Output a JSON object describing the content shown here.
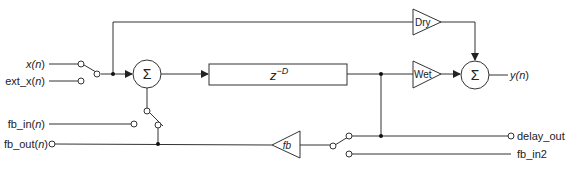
{
  "diagram": {
    "inputs": {
      "x_n": {
        "pre": "x(",
        "var": "n",
        "post": ")"
      },
      "ext_x_n": {
        "pre": "ext_x(",
        "var": "n",
        "post": ")"
      },
      "fb_in_n": {
        "pre": "fb_in(",
        "var": "n",
        "post": ")"
      },
      "fb_out_n": {
        "pre": "fb_out(",
        "var": "n",
        "post": ")"
      }
    },
    "outputs": {
      "y_n": {
        "pre": "y(",
        "var": "n",
        "post": ")"
      },
      "delay_out": "delay_out",
      "fb_in2": "fb_in2"
    },
    "blocks": {
      "sum_symbol": "Σ",
      "delay_base": "z",
      "delay_exp": "−D",
      "dry_gain": "Dry",
      "wet_gain": "Wet",
      "fb_gain": "fb"
    },
    "colors": {
      "stroke": "#333333",
      "text": "#222222"
    }
  }
}
